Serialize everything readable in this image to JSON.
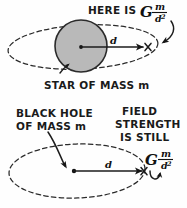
{
  "figure": {
    "background_color": "#fefefe",
    "ink_color": "#1c1c1c",
    "star_fill_color": "#b9b9b9"
  },
  "top_panel": {
    "name": "star-panel",
    "callout": {
      "prefix": "HERE IS",
      "formula": {
        "constant": "G",
        "numerator": "m",
        "denominator_base": "d",
        "denominator_exponent": "2",
        "plain": "G m/d²"
      }
    },
    "caption": "STAR OF MASS m",
    "distance_label": "d",
    "field_point_marker": "×",
    "orbit_style": "dashed-ellipse",
    "body_type": "filled-circle"
  },
  "bottom_panel": {
    "name": "black-hole-panel",
    "caption_lines": [
      "BLACK HOLE",
      "OF MASS m"
    ],
    "note_lines": [
      "FIELD",
      "STRENGTH",
      "IS STILL"
    ],
    "formula": {
      "constant": "G",
      "numerator": "m",
      "denominator_base": "d",
      "denominator_exponent": "2",
      "plain": "G m/d²"
    },
    "distance_label": "d",
    "field_point_marker": "×",
    "orbit_style": "dashed-ellipse",
    "body_type": "point-singularity"
  }
}
